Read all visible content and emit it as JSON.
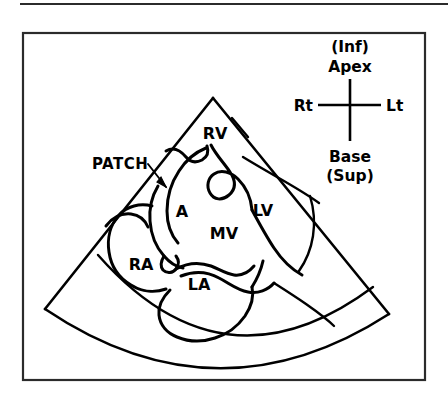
{
  "figure": {
    "type": "line-drawing",
    "title": "",
    "background_color": "#ffffff",
    "ink_color": "#000000",
    "frame_color": "#2b2b2b"
  },
  "annotation": {
    "patch_label": "PATCH",
    "patch_leader": "arrow pointing down-right from label to interatrial septum patch"
  },
  "chamber_labels": [
    {
      "id": "rv",
      "text": "RV",
      "meaning": "right ventricle",
      "x": 215,
      "y": 139
    },
    {
      "id": "lv",
      "text": "LV",
      "meaning": "left ventricle",
      "x": 263,
      "y": 216
    },
    {
      "id": "a",
      "text": "A",
      "meaning": "atrial septum / aneurysm",
      "x": 182,
      "y": 217
    },
    {
      "id": "mv",
      "text": "MV",
      "meaning": "mitral valve",
      "x": 224,
      "y": 239
    },
    {
      "id": "ra",
      "text": "RA",
      "meaning": "right atrium",
      "x": 141,
      "y": 270
    },
    {
      "id": "la",
      "text": "LA",
      "meaning": "left atrium",
      "x": 199,
      "y": 290
    }
  ],
  "compass": {
    "name": "orientation-compass",
    "top_line1": "(Inf)",
    "top_line2": "Apex",
    "left": "Rt",
    "right": "Lt",
    "bottom_line1": "Base",
    "bottom_line2": "(Sup)",
    "center_x": 350,
    "center_y": 105
  },
  "geometry": {
    "sector_apex_x": 213,
    "sector_apex_y": 98,
    "sector_left_corner_x": 45,
    "sector_left_corner_y": 309,
    "sector_right_corner_x": 389,
    "sector_right_corner_y": 314,
    "outer_arc_bottom_y": 369,
    "inner_arc_bottom_y": 345,
    "frame_left": 23,
    "frame_top": 33,
    "frame_right": 425,
    "frame_bottom": 380
  }
}
